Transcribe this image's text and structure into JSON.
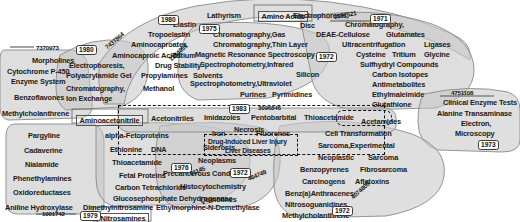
{
  "figure": {
    "type": "term-cluster-map"
  },
  "colors": {
    "cluster_fill": "#c9c9c9",
    "cluster_stroke": "#8a8a8a",
    "text": "#1a1a1a",
    "chip_border": "#3a3a3a",
    "chip_fill": "#fdfdfd",
    "highlight_dash": "#111111",
    "background": "#ffffff"
  },
  "terms": [
    {
      "text": "Amino Acids",
      "x": 258,
      "y": 11,
      "size": "term",
      "boxed": true
    },
    {
      "text": "Lathyrism",
      "x": 207,
      "y": 12,
      "size": "term"
    },
    {
      "text": "Elastin",
      "x": 173,
      "y": 21,
      "size": "term"
    },
    {
      "text": "Tropoelastin",
      "x": 148,
      "y": 31,
      "size": "term"
    },
    {
      "text": "Aminocaproates",
      "x": 131,
      "y": 41,
      "size": "term"
    },
    {
      "text": "Aminocaproic Acids",
      "x": 112,
      "y": 52,
      "size": "term"
    },
    {
      "text": "Electrophoresis,",
      "x": 293,
      "y": 12,
      "size": "term"
    },
    {
      "text": "Disc",
      "x": 300,
      "y": 22,
      "size": "term"
    },
    {
      "text": "Chromatography,",
      "x": 345,
      "y": 21,
      "size": "term"
    },
    {
      "text": "DEAE-Cellulose",
      "x": 316,
      "y": 31,
      "size": "term"
    },
    {
      "text": "Glutamates",
      "x": 386,
      "y": 31,
      "size": "term"
    },
    {
      "text": "Ultracentrifugation",
      "x": 342,
      "y": 41,
      "size": "term"
    },
    {
      "text": "Ligases",
      "x": 424,
      "y": 41,
      "size": "term"
    },
    {
      "text": "Cysteine",
      "x": 356,
      "y": 51,
      "size": "term"
    },
    {
      "text": "Tritium",
      "x": 392,
      "y": 51,
      "size": "term"
    },
    {
      "text": "Glycine",
      "x": 424,
      "y": 51,
      "size": "term"
    },
    {
      "text": "Sulfhydryl Compounds",
      "x": 360,
      "y": 61,
      "size": "term"
    },
    {
      "text": "Carbon Isotopes",
      "x": 372,
      "y": 71,
      "size": "term"
    },
    {
      "text": "Antimetabolites",
      "x": 372,
      "y": 81,
      "size": "term"
    },
    {
      "text": "Ethylmaleimide",
      "x": 372,
      "y": 91,
      "size": "term"
    },
    {
      "text": "Glutathione",
      "x": 372,
      "y": 101,
      "size": "term"
    },
    {
      "text": "Chromatography,Gas",
      "x": 213,
      "y": 31,
      "size": "term"
    },
    {
      "text": "Chromatography,Thin Layer",
      "x": 213,
      "y": 41,
      "size": "term"
    },
    {
      "text": "Magnetic Resonance Spectroscopy",
      "x": 195,
      "y": 51,
      "size": "term"
    },
    {
      "text": "Spectrophotometry,Infrared",
      "x": 200,
      "y": 61,
      "size": "term"
    },
    {
      "text": "Silicon",
      "x": 296,
      "y": 71,
      "size": "term"
    },
    {
      "text": "Spectrophotometry,Ultraviolet",
      "x": 190,
      "y": 80,
      "size": "term"
    },
    {
      "text": "Purines",
      "x": 240,
      "y": 91,
      "size": "term"
    },
    {
      "text": "Pyrimidines",
      "x": 272,
      "y": 91,
      "size": "term"
    },
    {
      "text": "Tritium",
      "x": 172,
      "y": 52,
      "size": "term"
    },
    {
      "text": "Drug Stability",
      "x": 155,
      "y": 62,
      "size": "term"
    },
    {
      "text": "Propylamines",
      "x": 141,
      "y": 72,
      "size": "term"
    },
    {
      "text": "Solvents",
      "x": 193,
      "y": 72,
      "size": "term"
    },
    {
      "text": "Methanol",
      "x": 143,
      "y": 85,
      "size": "term"
    },
    {
      "text": "Electrophoresis,",
      "x": 69,
      "y": 62,
      "size": "term"
    },
    {
      "text": "Polyacrylamide Gel",
      "x": 66,
      "y": 72,
      "size": "term"
    },
    {
      "text": "Chromatography,",
      "x": 66,
      "y": 85,
      "size": "term"
    },
    {
      "text": "Ion Exchange",
      "x": 66,
      "y": 95,
      "size": "term"
    },
    {
      "text": "Morpholines",
      "x": 32,
      "y": 57,
      "size": "term"
    },
    {
      "text": "Cytochrome P-450",
      "x": 7,
      "y": 68,
      "size": "term"
    },
    {
      "text": "Enzyme System",
      "x": 11,
      "y": 78,
      "size": "term"
    },
    {
      "text": "Benzoflavones",
      "x": 14,
      "y": 94,
      "size": "term"
    },
    {
      "text": "Methylcholanthrene",
      "x": 2,
      "y": 110,
      "size": "term"
    },
    {
      "text": "Clinical Enzyme Tests",
      "x": 443,
      "y": 99,
      "size": "term"
    },
    {
      "text": "Alanine Transaminase",
      "x": 437,
      "y": 110,
      "size": "term"
    },
    {
      "text": "Electron,",
      "x": 461,
      "y": 120,
      "size": "term"
    },
    {
      "text": "Microscopy",
      "x": 455,
      "y": 130,
      "size": "term"
    },
    {
      "text": "Aminoacetonitrile",
      "x": 76,
      "y": 115,
      "size": "term",
      "boxed": true
    },
    {
      "text": "Acetonitriles",
      "x": 151,
      "y": 115,
      "size": "term"
    },
    {
      "text": "Imidazoles",
      "x": 204,
      "y": 114,
      "size": "term"
    },
    {
      "text": "Pentobarbital",
      "x": 251,
      "y": 114,
      "size": "term"
    },
    {
      "text": "Thioacetamide",
      "x": 304,
      "y": 114,
      "size": "term"
    },
    {
      "text": "Acetamides",
      "x": 361,
      "y": 118,
      "size": "term"
    },
    {
      "text": "Necrosis",
      "x": 234,
      "y": 126,
      "size": "term"
    },
    {
      "text": "Drug-Induced Liver Injury",
      "x": 208,
      "y": 139,
      "size": "term-sm"
    },
    {
      "text": "Liver Diseases",
      "x": 225,
      "y": 148,
      "size": "term-sm"
    },
    {
      "text": "alpha-Fetoproteins",
      "x": 105,
      "y": 132,
      "size": "term"
    },
    {
      "text": "Pargyline",
      "x": 28,
      "y": 132,
      "size": "term"
    },
    {
      "text": "Cadaverine",
      "x": 24,
      "y": 147,
      "size": "term"
    },
    {
      "text": "Nialamide",
      "x": 25,
      "y": 161,
      "size": "term"
    },
    {
      "text": "Phenethylamines",
      "x": 13,
      "y": 175,
      "size": "term"
    },
    {
      "text": "Oxidoreductases",
      "x": 13,
      "y": 189,
      "size": "term"
    },
    {
      "text": "Aniline Hydroxylase",
      "x": 5,
      "y": 204,
      "size": "term"
    },
    {
      "text": "Ethionine",
      "x": 110,
      "y": 146,
      "size": "term"
    },
    {
      "text": "DNA",
      "x": 151,
      "y": 146,
      "size": "term"
    },
    {
      "text": "Thioacetamide",
      "x": 112,
      "y": 159,
      "size": "term"
    },
    {
      "text": "Fetal Proteins",
      "x": 119,
      "y": 172,
      "size": "term"
    },
    {
      "text": "Carbon Tetrachloride",
      "x": 115,
      "y": 184,
      "size": "term"
    },
    {
      "text": "Glucosephosphate Dehydrogenase",
      "x": 113,
      "y": 195,
      "size": "term"
    },
    {
      "text": "Dimethylnitrosamine",
      "x": 83,
      "y": 204,
      "size": "term"
    },
    {
      "text": "Ethylmorphine-N-Demethylase",
      "x": 156,
      "y": 204,
      "size": "term"
    },
    {
      "text": "Nitrosamines",
      "x": 97,
      "y": 213,
      "size": "term",
      "boxed": true
    },
    {
      "text": "Iron",
      "x": 212,
      "y": 130,
      "size": "term"
    },
    {
      "text": "Fluorenes",
      "x": 256,
      "y": 130,
      "size": "term"
    },
    {
      "text": "Siderosis",
      "x": 203,
      "y": 144,
      "size": "term"
    },
    {
      "text": "Neoplasms",
      "x": 198,
      "y": 157,
      "size": "term"
    },
    {
      "text": "Precancerous Conditions",
      "x": 163,
      "y": 170,
      "size": "term"
    },
    {
      "text": "Histocytochemistry",
      "x": 180,
      "y": 183,
      "size": "term"
    },
    {
      "text": "Quinolines",
      "x": 200,
      "y": 196,
      "size": "term"
    },
    {
      "text": "Cell Transformation",
      "x": 325,
      "y": 130,
      "size": "term"
    },
    {
      "text": "Sarcoma,Experimental",
      "x": 318,
      "y": 142,
      "size": "term"
    },
    {
      "text": "Neoplastic",
      "x": 318,
      "y": 154,
      "size": "term"
    },
    {
      "text": "Sarcoma",
      "x": 368,
      "y": 154,
      "size": "term"
    },
    {
      "text": "Benzopyrenes",
      "x": 300,
      "y": 166,
      "size": "term"
    },
    {
      "text": "Fibrosarcoma",
      "x": 360,
      "y": 166,
      "size": "term"
    },
    {
      "text": "Carcinogens",
      "x": 302,
      "y": 178,
      "size": "term"
    },
    {
      "text": "Aflatoxins",
      "x": 355,
      "y": 178,
      "size": "term"
    },
    {
      "text": "Benz(a)Anthracenes",
      "x": 285,
      "y": 190,
      "size": "term"
    },
    {
      "text": "Nitrosoguanidines",
      "x": 285,
      "y": 201,
      "size": "term"
    },
    {
      "text": "Methylcholanthrene",
      "x": 282,
      "y": 212,
      "size": "term"
    }
  ],
  "year_chips": [
    {
      "text": "1980",
      "x": 76,
      "y": 45
    },
    {
      "text": "1980",
      "x": 158,
      "y": 15
    },
    {
      "text": "1975",
      "x": 199,
      "y": 24
    },
    {
      "text": "1971",
      "x": 370,
      "y": 14
    },
    {
      "text": "1972",
      "x": 316,
      "y": 52
    },
    {
      "text": "1983",
      "x": 229,
      "y": 104
    },
    {
      "text": "1973",
      "x": 478,
      "y": 140
    },
    {
      "text": "1976",
      "x": 171,
      "y": 163
    },
    {
      "text": "1972",
      "x": 230,
      "y": 168
    },
    {
      "text": "1979",
      "x": 80,
      "y": 211
    },
    {
      "text": "1972",
      "x": 332,
      "y": 206
    }
  ],
  "id_numbers": [
    {
      "text": "7370973",
      "x": 36,
      "y": 45,
      "rotate": 0
    },
    {
      "text": "7437864",
      "x": 106,
      "y": 45,
      "rotate": -40
    },
    {
      "text": "1174051",
      "x": 170,
      "y": 57,
      "rotate": -42
    },
    {
      "text": "3097521",
      "x": 334,
      "y": 14,
      "rotate": -10
    },
    {
      "text": "4751108",
      "x": 451,
      "y": 90,
      "rotate": 0
    },
    {
      "text": "3096846",
      "x": 258,
      "y": 105,
      "rotate": 0
    },
    {
      "text": "61145",
      "x": 190,
      "y": 171,
      "rotate": -22
    },
    {
      "text": "464749",
      "x": 248,
      "y": 176,
      "rotate": -22
    },
    {
      "text": "1001742",
      "x": 42,
      "y": 211,
      "rotate": 0
    },
    {
      "text": "4074800",
      "x": 352,
      "y": 195,
      "rotate": -42
    }
  ],
  "highlight_boxes": [
    {
      "name": "drug-induced-liver-injury-cluster",
      "x": 118,
      "y": 105,
      "width": 265,
      "height": 48
    },
    {
      "name": "acetamides-focus",
      "x": 336,
      "y": 110,
      "width": 54,
      "height": 14
    }
  ]
}
